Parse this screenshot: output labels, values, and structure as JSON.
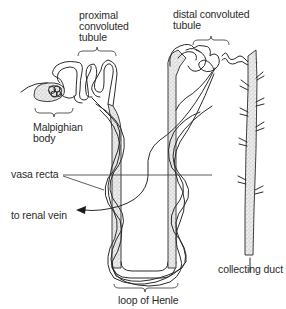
{
  "diagram": {
    "labels": {
      "proximal": [
        "proximal",
        "convoluted",
        "tubule"
      ],
      "distal": [
        "distal convoluted",
        "tubule"
      ],
      "malpighian": [
        "Malpighian",
        "body"
      ],
      "vasa_recta": "vasa recta",
      "renal_vein": "to renal vein",
      "loop_of_henle": "loop of Henle",
      "collecting_duct": "collecting duct"
    },
    "colors": {
      "ink": "#2b2b2b",
      "stipple": "#9a9a9a",
      "background": "#ffffff"
    }
  }
}
